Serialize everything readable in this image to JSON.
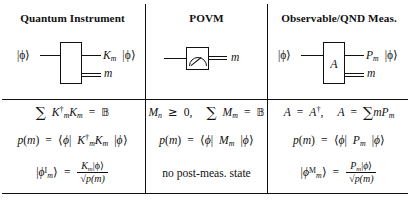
{
  "figure": {
    "type": "three-column comparison table of quantum measurement formalisms",
    "columns": [
      {
        "id": "quantum-instrument",
        "title": "Quantum Instrument",
        "circuit": {
          "input_label": "|ϕ⟩",
          "output_label_main": "K",
          "output_label_sub": "m",
          "output_label_ket": "|ϕ⟩",
          "classical_output_label": "m",
          "box_label": ""
        },
        "rows": {
          "condition_lead": "",
          "probability": "p(m) = ⟨ϕ| K",
          "post_state_label": "|ϕ",
          "post_state_sup": "I",
          "post_state_sub": "m",
          "post_state_numerator": "K",
          "post_state_numerator_sub": "m",
          "post_state_numerator_ket": "|ϕ⟩",
          "post_state_denominator": "p(m)"
        }
      },
      {
        "id": "povm",
        "title": "POVM",
        "circuit": {
          "input_label": "",
          "classical_output_label": "m",
          "meter_icon": "meter-gauge-icon"
        },
        "rows": {
          "post_state_text": "no post-meas. state"
        }
      },
      {
        "id": "observable-qnd",
        "title": "Observable/QND Meas.",
        "circuit": {
          "input_label": "|ϕ⟩",
          "box_label": "A",
          "output_label_main": "P",
          "output_label_sub": "m",
          "output_label_ket": "|ϕ⟩",
          "classical_output_label": "m"
        },
        "rows": {
          "post_state_sup": "M",
          "post_state_numerator": "P",
          "post_state_denominator": "p(m)"
        }
      }
    ],
    "equations": {
      "c1r1": "∑ K†ₘ Kₘ = 𝟙",
      "c1r2": "p(m) = ⟨ϕ| K†ₘ Kₘ |ϕ⟩",
      "c1r3": "|ϕᴹₘ⟩ = Kₘ|ϕ⟩ / √p(m)",
      "c2r1": "Mₙ ≥ 0,   ∑ Mₘ = 𝟙",
      "c2r2": "p(m) = ⟨ϕ| Mₘ |ϕ⟩",
      "c2r3": "no post-meas. state",
      "c3r1": "A = A†,   A = ∑ m Pₘ",
      "c3r2": "p(m) = ⟨ϕ| Pₘ |ϕ⟩",
      "c3r3": "|ϕᴹₘ⟩ = Pₘ|ϕ⟩ / √p(m)"
    },
    "symbols": {
      "ket_phi": "|ϕ⟩",
      "bra_phi": "⟨ϕ|",
      "sum": "∑",
      "dagger": "†",
      "identity": "𝟙",
      "geq": "≥",
      "eq": "=",
      "m": "m",
      "K": "K",
      "M": "M",
      "P": "P",
      "A": "A",
      "p_of_m": "p(m)",
      "no_post_meas": "no post-meas. state",
      "comma": ","
    },
    "style": {
      "ink": "#111111",
      "paper": "#ffffff"
    }
  }
}
